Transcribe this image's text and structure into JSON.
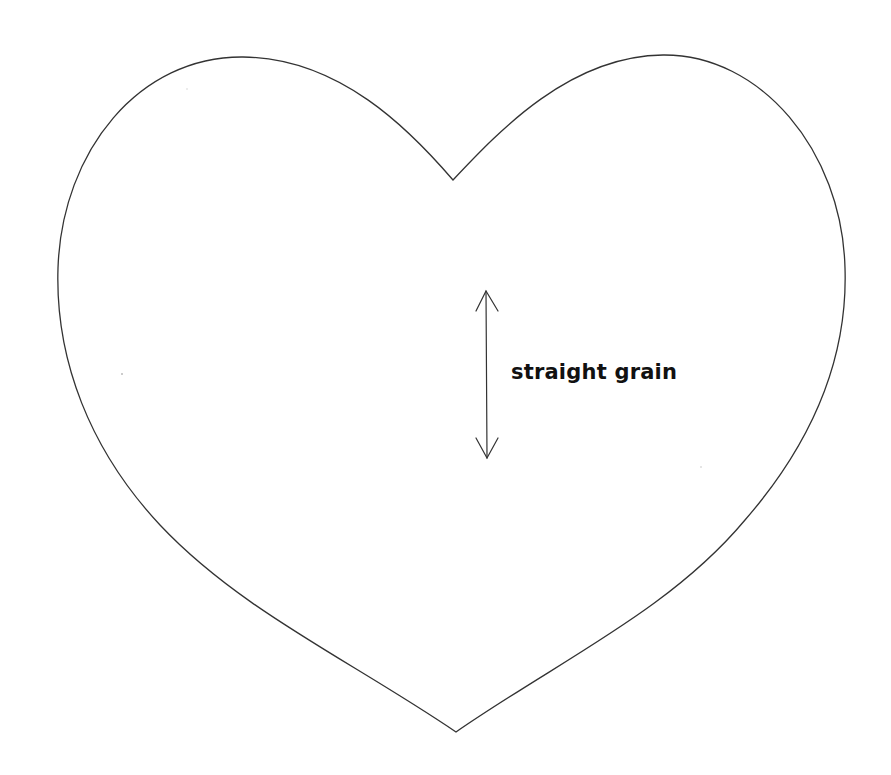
{
  "document": {
    "type": "sewing pattern template",
    "shape": "heart",
    "outline_color": "#333333",
    "background_color": "#ffffff"
  },
  "grain_marker": {
    "label": "straight grain",
    "direction": "vertical, double-headed arrow"
  }
}
